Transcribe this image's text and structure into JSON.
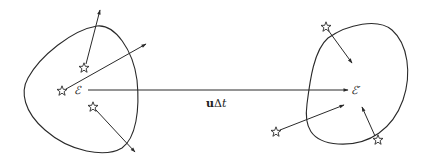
{
  "diagram": {
    "type": "physics-schematic",
    "left_region": {
      "label": "ℰ",
      "stars": [
        {
          "x": 84,
          "y": 68,
          "arrow_to": [
            100,
            10
          ]
        },
        {
          "x": 62,
          "y": 91,
          "arrow_to": [
            146,
            44
          ]
        },
        {
          "x": 93,
          "y": 107,
          "arrow_to": [
            135,
            152
          ]
        }
      ]
    },
    "right_region": {
      "label": "ℰ′",
      "stars": [
        {
          "x": 326,
          "y": 27,
          "arrow_to": [
            352,
            63
          ]
        },
        {
          "x": 276,
          "y": 132,
          "arrow_to": [
            344,
            105
          ]
        },
        {
          "x": 378,
          "y": 140,
          "arrow_from": [
            362,
            107
          ]
        }
      ]
    },
    "displacement": {
      "label_bold": "u",
      "label_rest": "Δ",
      "label_italic": "t",
      "full_label": "uΔt",
      "from": [
        88,
        90
      ],
      "to": [
        348,
        90
      ]
    },
    "colors": {
      "stroke": "#2a2a2a",
      "background": "#ffffff"
    }
  }
}
